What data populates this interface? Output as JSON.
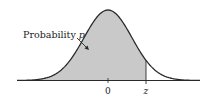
{
  "diagram": {
    "type": "normal-distribution",
    "annotation_label": "Probability",
    "annotation_var": "p",
    "tick_labels": {
      "center": "0",
      "z": "z"
    },
    "colors": {
      "shade": "#c9c9c9",
      "curve": "#2a2a2a",
      "axis": "#2a2a2a"
    }
  }
}
